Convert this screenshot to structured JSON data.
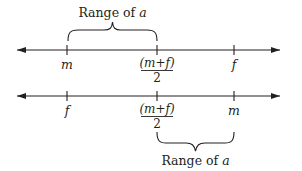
{
  "diagram": {
    "top_line": {
      "ticks": [
        {
          "id": "m",
          "label": "m",
          "x": 67
        },
        {
          "id": "mid",
          "numerator": "(m+f)",
          "denominator": "2",
          "x": 157
        },
        {
          "id": "f",
          "label": "f",
          "x": 234
        }
      ],
      "brace": {
        "from": "m",
        "to": "mid",
        "position": "above",
        "label_prefix": "Range of ",
        "label_var": "a"
      }
    },
    "bottom_line": {
      "ticks": [
        {
          "id": "f",
          "label": "f",
          "x": 67
        },
        {
          "id": "mid",
          "numerator": "(m+f)",
          "denominator": "2",
          "x": 157
        },
        {
          "id": "m",
          "label": "m",
          "x": 234
        }
      ],
      "brace": {
        "from": "mid",
        "to": "m",
        "position": "below",
        "label_prefix": "Range of ",
        "label_var": "a"
      }
    },
    "colors": {
      "ink": "#231f20",
      "background": "#ffffff"
    }
  }
}
